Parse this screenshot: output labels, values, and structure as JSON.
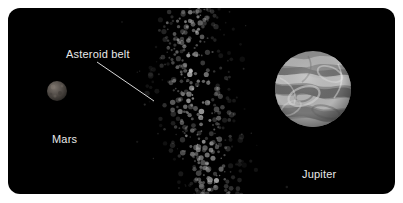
{
  "scene": {
    "background_color": "#ffffff",
    "panel_color": "#000000",
    "panel_corner_radius": 12
  },
  "labels": {
    "asteroid_belt": "Asteroid belt",
    "mars": "Mars",
    "jupiter": "Jupiter",
    "text_color": "#e8e8e8"
  },
  "bodies": {
    "mars": {
      "name": "Mars",
      "center_x": 49,
      "center_y": 83,
      "radius": 10,
      "base_color": "#4a4643",
      "highlight_color": "#6e6862"
    },
    "jupiter": {
      "name": "Jupiter",
      "center_x": 305,
      "center_y": 81,
      "radius": 38,
      "base_color": "#8d8d8d",
      "band_light_color": "#c8c8c8",
      "band_dark_color": "#5d5d5d"
    }
  },
  "asteroid_belt": {
    "name": "Asteroid belt",
    "particle_color": "#8a8a8a",
    "particle_count": 420,
    "band_start_x": 178,
    "band_end_x": 212,
    "curve_inflection_y": 105
  },
  "leader_line": {
    "from_x": 89,
    "from_y": 54,
    "to_x": 146,
    "to_y": 93,
    "color": "#d8d8d8",
    "width": 1
  }
}
